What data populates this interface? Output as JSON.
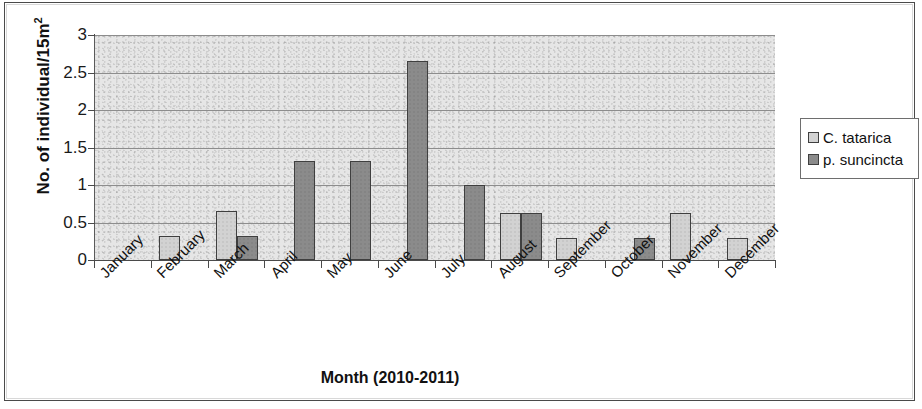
{
  "chart_data": {
    "type": "bar",
    "title": "",
    "xlabel": "Month (2010-2011)",
    "ylabel": "No. of individual/15m2",
    "ylabel_base": "No. of individual/15m",
    "ylabel_sup": "2",
    "ylim": [
      0,
      3
    ],
    "yticks": [
      "0",
      "0.5",
      "1",
      "1.5",
      "2",
      "2.5",
      "3"
    ],
    "ytick_values": [
      0,
      0.5,
      1,
      1.5,
      2,
      2.5,
      3
    ],
    "grid": "horizontal",
    "legend_position": "right",
    "categories": [
      "January",
      "February",
      "March",
      "April",
      "May",
      "June",
      "July",
      "August",
      "September",
      "October",
      "November",
      "December"
    ],
    "series": [
      {
        "name": "C. tatarica",
        "color": "#d2d2d2",
        "values": [
          0,
          0.32,
          0.65,
          0,
          0,
          0,
          0,
          0.63,
          0.3,
          0,
          0.63,
          0.29
        ]
      },
      {
        "name": "p. suncincta",
        "color": "#8b8b8b",
        "values": [
          0,
          0,
          0.32,
          1.32,
          1.32,
          2.65,
          1.0,
          0.63,
          0,
          0.3,
          0,
          0
        ]
      }
    ]
  },
  "legend": {
    "items": [
      {
        "label": "C. tatarica",
        "swatch": "#d2d2d2"
      },
      {
        "label": "p. suncincta",
        "swatch": "#8b8b8b"
      }
    ]
  }
}
